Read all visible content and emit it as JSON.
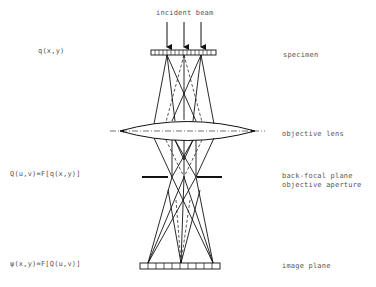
{
  "diagram": {
    "title_label": "incident beam",
    "left_labels": {
      "specimen_function": "q(x,y)",
      "back_focal_function": "Q(u,v)=F[q(x,y)]",
      "image_function": "ψ(x,y)=F[Q(u,v)]"
    },
    "right_labels": {
      "specimen": "specimen",
      "objective_lens": "objective lens",
      "back_focal_plane": "back-focal plane",
      "objective_aperture": "objective aperture",
      "image_plane": "image plane"
    },
    "colors": {
      "line": "#111111",
      "text": "#555555",
      "background": "#ffffff"
    }
  }
}
